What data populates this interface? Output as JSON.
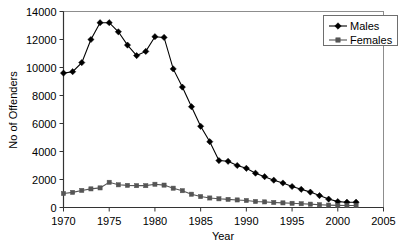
{
  "chart_data": {
    "type": "line",
    "title": "",
    "xlabel": "Year",
    "ylabel": "No of Offenders",
    "xlim": [
      1970,
      2005
    ],
    "ylim": [
      0,
      14000
    ],
    "xticks": [
      1970,
      1975,
      1980,
      1985,
      1990,
      1995,
      2000,
      2005
    ],
    "yticks": [
      0,
      2000,
      4000,
      6000,
      8000,
      10000,
      12000,
      14000
    ],
    "grid": false,
    "legend_position": "top-right",
    "x": [
      1970,
      1971,
      1972,
      1973,
      1974,
      1975,
      1976,
      1977,
      1978,
      1979,
      1980,
      1981,
      1982,
      1983,
      1984,
      1985,
      1986,
      1987,
      1988,
      1989,
      1990,
      1991,
      1992,
      1993,
      1994,
      1995,
      1996,
      1997,
      1998,
      1999,
      2000,
      2001,
      2002
    ],
    "series": [
      {
        "name": "Males",
        "marker": "diamond",
        "color": "#000000",
        "values": [
          9600,
          9700,
          10350,
          12000,
          13200,
          13200,
          12550,
          11600,
          10850,
          11150,
          12200,
          12150,
          9900,
          8600,
          7200,
          5800,
          4700,
          3350,
          3300,
          3000,
          2800,
          2450,
          2200,
          1950,
          1750,
          1500,
          1300,
          1100,
          850,
          600,
          420,
          380,
          380
        ]
      },
      {
        "name": "Females",
        "marker": "square",
        "color": "#555555",
        "values": [
          1000,
          1080,
          1220,
          1330,
          1400,
          1800,
          1620,
          1580,
          1560,
          1560,
          1660,
          1600,
          1380,
          1200,
          950,
          780,
          680,
          620,
          580,
          540,
          500,
          430,
          400,
          360,
          330,
          300,
          270,
          240,
          200,
          170,
          150,
          140,
          140
        ]
      }
    ],
    "xtick_labels": [
      "1970",
      "1975",
      "1980",
      "1985",
      "1990",
      "1995",
      "2000",
      "2005"
    ],
    "ytick_labels": [
      "0",
      "2000",
      "4000",
      "6000",
      "8000",
      "10000",
      "12000",
      "14000"
    ],
    "legend_entries": [
      "Males",
      "Females"
    ]
  }
}
